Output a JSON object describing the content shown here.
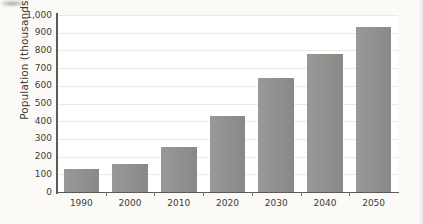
{
  "chart_data": {
    "type": "bar",
    "title": "",
    "subtitle": "",
    "xlabel": "",
    "ylabel": "Population (thousands)",
    "categories": [
      "1990",
      "2000",
      "2010",
      "2020",
      "2030",
      "2040",
      "2050"
    ],
    "values": [
      130,
      160,
      255,
      430,
      645,
      780,
      935
    ],
    "series": [
      {
        "name": "Population",
        "values": [
          130,
          160,
          255,
          430,
          645,
          780,
          935
        ]
      }
    ],
    "ylim": [
      0,
      1000
    ],
    "y_ticks": [
      0,
      100,
      200,
      300,
      400,
      500,
      600,
      700,
      800,
      900,
      1000
    ],
    "y_tick_labels": [
      "0",
      "100",
      "200",
      "300",
      "400",
      "500",
      "600",
      "700",
      "800",
      "900",
      "1,000"
    ],
    "x_tick_labels": [
      "1990",
      "2000",
      "2010",
      "2020",
      "2030",
      "2040",
      "2050"
    ],
    "grid": true,
    "grid_axis": "y",
    "legend": false,
    "legend_position": "none",
    "annotations": [],
    "bar_color": "#8d8d8c",
    "plot_background": "#ffffff",
    "figure_background": "#fbfaf7",
    "grid_color": "#efe9e2",
    "axis_color": "#5d5b57",
    "text_color": "#3b3a38"
  }
}
